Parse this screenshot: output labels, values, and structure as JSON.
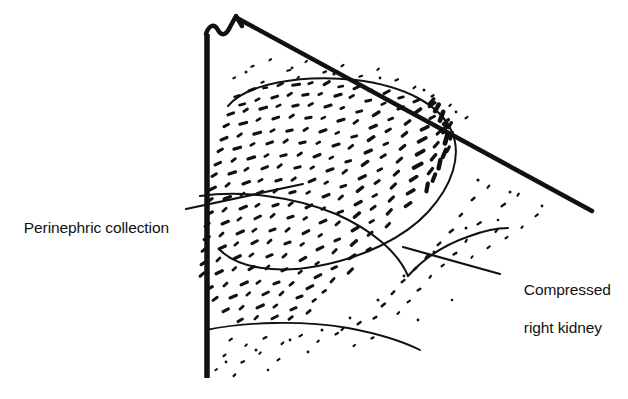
{
  "figure": {
    "name": "renal-ultrasound-line-drawing",
    "background_color": "#ffffff",
    "ink_color": "#111111",
    "width": 628,
    "height": 399,
    "modality": "ultrasound-sector-scan-schematic"
  },
  "annotations": {
    "perinephric": {
      "label": "Perinephric collection",
      "leader_from": [
        193,
        209
      ],
      "leader_to": [
        300,
        185
      ]
    },
    "kidney": {
      "label_line1": "Compressed",
      "label_line2": "right kidney",
      "leader_from": [
        498,
        274
      ],
      "leader_to": [
        410,
        249
      ]
    }
  },
  "scan_sector": {
    "apex_label": "transducer-apex",
    "left_edge_label": "sector-left-edge",
    "right_edge_label": "sector-right-edge"
  },
  "regions": {
    "collection_label": "perinephric-collection-echo-region",
    "kidney_label": "compressed-right-kidney-outline"
  }
}
